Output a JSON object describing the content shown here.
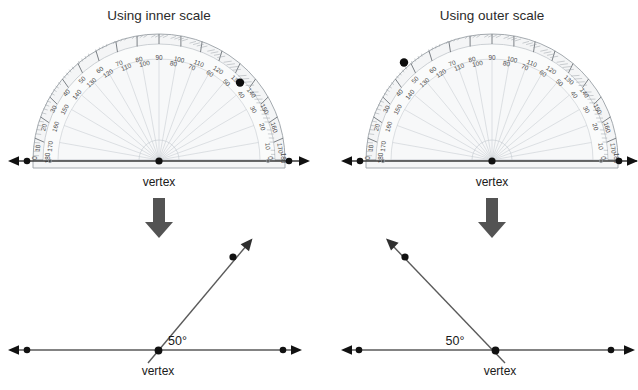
{
  "page": {
    "background_color": "#ffffff",
    "width": 638,
    "height": 390
  },
  "panels": [
    {
      "id": "left",
      "title": "Using inner scale",
      "protractor": {
        "vertex_label": "vertex",
        "marker_dot_degrees": 130,
        "baseline_dot_left_label": "",
        "baseline_dot_right_label": "",
        "outer_scale_labels": [
          "0",
          "10",
          "20",
          "30",
          "40",
          "50",
          "60",
          "70",
          "80",
          "90",
          "100",
          "110",
          "120",
          "130",
          "140",
          "150",
          "160",
          "170",
          "180"
        ],
        "inner_scale_labels": [
          "180",
          "170",
          "160",
          "150",
          "140",
          "130",
          "120",
          "110",
          "100",
          "90",
          "80",
          "70",
          "60",
          "50",
          "40",
          "30",
          "20",
          "10",
          "0"
        ],
        "body_color": "#f4f5f6",
        "edge_color": "#9aa0a6"
      },
      "arrow": {
        "icon": "down-arrow-icon",
        "color": "#535353"
      },
      "angle": {
        "value_label": "50°",
        "vertex_label": "vertex",
        "ray_degrees": 50,
        "line_color": "#5a5a5a",
        "dot_color": "#101010"
      }
    },
    {
      "id": "right",
      "title": "Using outer scale",
      "protractor": {
        "vertex_label": "vertex",
        "marker_dot_degrees": 130,
        "baseline_dot_left_label": "",
        "baseline_dot_right_label": "",
        "outer_scale_labels": [
          "0",
          "10",
          "20",
          "30",
          "40",
          "50",
          "60",
          "70",
          "80",
          "90",
          "100",
          "110",
          "120",
          "130",
          "140",
          "150",
          "160",
          "170",
          "180"
        ],
        "inner_scale_labels": [
          "180",
          "170",
          "160",
          "150",
          "140",
          "130",
          "120",
          "110",
          "100",
          "90",
          "80",
          "70",
          "60",
          "50",
          "40",
          "30",
          "20",
          "10",
          "0"
        ],
        "body_color": "#f4f5f6",
        "edge_color": "#9aa0a6"
      },
      "arrow": {
        "icon": "down-arrow-icon",
        "color": "#535353"
      },
      "angle": {
        "value_label": "50°",
        "vertex_label": "vertex",
        "ray_degrees": 130,
        "line_color": "#5a5a5a",
        "dot_color": "#101010"
      }
    }
  ]
}
